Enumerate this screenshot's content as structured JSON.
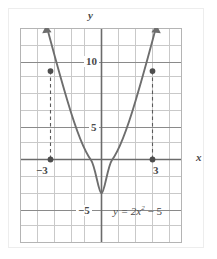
{
  "figure": {
    "type": "cartesian-graph",
    "caption_equation": "y = 2x² − 5"
  },
  "axes": {
    "x_axis_label": "x",
    "y_axis_label": "y",
    "x_tick_labels": [
      "−3",
      "3"
    ],
    "y_tick_labels": [
      "10",
      "5",
      "−5"
    ],
    "x_range": [
      -4.8,
      4.8
    ],
    "y_range": [
      -10,
      21.5
    ],
    "grid": "on",
    "grid_step_x": 1,
    "grid_step_y": 2.5,
    "axis_color": "#6b6b6b",
    "grid_color": "#c9c9c9",
    "curve_color": "#6e6e6e"
  },
  "chart_data": {
    "type": "line",
    "title": "",
    "xlabel": "x",
    "ylabel": "y",
    "equation": "y = 2x^2 - 5",
    "xlim": [
      -4.8,
      4.8
    ],
    "ylim": [
      -10,
      21.5
    ],
    "grid": true,
    "legend": "none",
    "annotations": [
      {
        "text": "y = 2x² − 5",
        "x": 1.0,
        "y": -5.6
      }
    ],
    "series": [
      {
        "name": "y = 2x^2 - 5",
        "x": [
          -3.2,
          -3.0,
          -2.5,
          -2.0,
          -1.5,
          -1.0,
          -0.5,
          0.0,
          0.5,
          1.0,
          1.5,
          2.0,
          2.5,
          3.0,
          3.2
        ],
        "values": [
          15.48,
          13.0,
          7.5,
          3.0,
          -0.5,
          -3.0,
          -4.5,
          -5.0,
          -4.5,
          -3.0,
          -0.5,
          3.0,
          7.5,
          13.0,
          15.48
        ]
      }
    ],
    "points": [
      {
        "label": "curve-point-left",
        "x": -3,
        "y": 13
      },
      {
        "label": "axis-point-left",
        "x": -3,
        "y": 0
      },
      {
        "label": "curve-point-right",
        "x": 3,
        "y": 13
      },
      {
        "label": "axis-point-right",
        "x": 3,
        "y": 0
      }
    ],
    "dashed_connectors": [
      {
        "from": [
          -3,
          13
        ],
        "to": [
          -3,
          0
        ]
      },
      {
        "from": [
          3,
          13
        ],
        "to": [
          3,
          0
        ]
      }
    ],
    "vertex": {
      "x": 0,
      "y": -5
    },
    "y_intercept": -5,
    "marked_x_values": [
      -3,
      3
    ],
    "marked_y_value": 13
  }
}
